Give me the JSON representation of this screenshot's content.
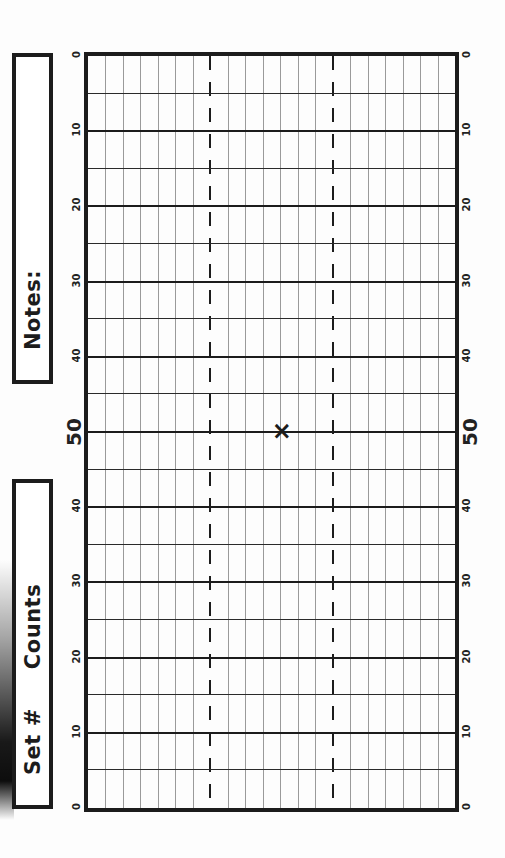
{
  "sheet": {
    "title": "Football field marching chart",
    "labels": {
      "notes": "Notes:",
      "set_number": "Set #",
      "counts": "Counts"
    },
    "field": {
      "yard_labels_left": [
        "0",
        "10",
        "20",
        "30",
        "40",
        "50",
        "40",
        "30",
        "20",
        "10",
        "0"
      ],
      "yard_labels_right": [
        "0",
        "10",
        "20",
        "30",
        "40",
        "50",
        "40",
        "30",
        "20",
        "10",
        "0"
      ],
      "yard_line_count": 21,
      "grid_columns": 21,
      "dashed_columns": [
        7,
        14
      ],
      "center_mark": "×",
      "line_color": "#1c1c1c",
      "grid_color": "#9a9a9a"
    }
  }
}
